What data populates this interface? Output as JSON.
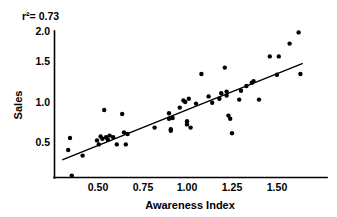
{
  "chart_data": {
    "type": "scatter",
    "title": "",
    "xlabel": "Awareness Index",
    "ylabel": "Sales",
    "annotation": "r²= 0.73",
    "r_squared": 0.73,
    "grid": false,
    "legend": "none",
    "xlim": [
      0.3,
      1.65
    ],
    "ylim": [
      0.05,
      2.05
    ],
    "xticks": [
      0.5,
      0.75,
      1.0,
      1.25,
      1.5
    ],
    "xticklabels": [
      "0.50",
      "0.75",
      "1.00",
      "1.25",
      "1.50"
    ],
    "yticks": [
      0.5,
      1.0,
      1.5,
      2.0
    ],
    "yticklabels": [
      "0.5",
      "1.0",
      "1.5",
      "2.0"
    ],
    "marker": "filled-circle",
    "marker_color": "#000000",
    "series": [
      {
        "name": "Sales vs Awareness Index",
        "points": [
          [
            0.34,
            0.4
          ],
          [
            0.35,
            0.55
          ],
          [
            0.36,
            0.08
          ],
          [
            0.42,
            0.33
          ],
          [
            0.5,
            0.52
          ],
          [
            0.51,
            0.47
          ],
          [
            0.52,
            0.57
          ],
          [
            0.53,
            0.54
          ],
          [
            0.54,
            0.9
          ],
          [
            0.55,
            0.56
          ],
          [
            0.56,
            0.53
          ],
          [
            0.57,
            0.58
          ],
          [
            0.59,
            0.56
          ],
          [
            0.61,
            0.47
          ],
          [
            0.64,
            0.85
          ],
          [
            0.65,
            0.62
          ],
          [
            0.66,
            0.47
          ],
          [
            0.67,
            0.6
          ],
          [
            0.82,
            0.68
          ],
          [
            0.9,
            0.86
          ],
          [
            0.9,
            0.79
          ],
          [
            0.91,
            0.66
          ],
          [
            0.91,
            0.64
          ],
          [
            0.92,
            0.8
          ],
          [
            0.96,
            0.93
          ],
          [
            0.98,
            1.02
          ],
          [
            0.99,
            1.0
          ],
          [
            1.0,
            0.76
          ],
          [
            1.0,
            0.72
          ],
          [
            1.01,
            1.04
          ],
          [
            1.02,
            0.68
          ],
          [
            1.05,
            0.98
          ],
          [
            1.08,
            1.35
          ],
          [
            1.12,
            1.07
          ],
          [
            1.14,
            0.99
          ],
          [
            1.18,
            1.04
          ],
          [
            1.19,
            1.11
          ],
          [
            1.21,
            1.43
          ],
          [
            1.22,
            1.13
          ],
          [
            1.22,
            1.08
          ],
          [
            1.23,
            0.83
          ],
          [
            1.24,
            0.79
          ],
          [
            1.25,
            0.61
          ],
          [
            1.29,
            1.03
          ],
          [
            1.3,
            1.14
          ],
          [
            1.33,
            1.2
          ],
          [
            1.36,
            1.24
          ],
          [
            1.37,
            1.26
          ],
          [
            1.4,
            1.03
          ],
          [
            1.46,
            1.57
          ],
          [
            1.5,
            1.34
          ],
          [
            1.51,
            1.57
          ],
          [
            1.57,
            1.73
          ],
          [
            1.62,
            1.87
          ],
          [
            1.63,
            1.35
          ]
        ]
      }
    ],
    "fit_line": {
      "name": "least-squares regression line",
      "x_start": 0.31,
      "y_start": 0.28,
      "x_end": 1.64,
      "y_end": 1.48
    }
  }
}
